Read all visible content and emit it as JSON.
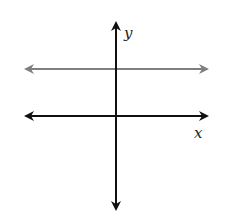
{
  "figure": {
    "type": "coordinate-plane",
    "x_axis_label": "x",
    "y_axis_label": "y",
    "colors": {
      "axes": "#111111",
      "horizontal_line": "#7f7f7f",
      "background": "#ffffff"
    },
    "elements": [
      {
        "name": "x-axis",
        "kind": "double-arrow line",
        "orientation": "horizontal"
      },
      {
        "name": "y-axis",
        "kind": "double-arrow line",
        "orientation": "vertical"
      },
      {
        "name": "horizontal-line",
        "kind": "double-arrow line",
        "orientation": "horizontal",
        "position": "above x-axis (y = positive constant)",
        "color": "gray"
      }
    ]
  }
}
